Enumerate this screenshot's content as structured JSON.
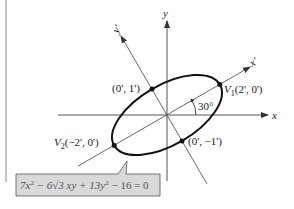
{
  "diagram": {
    "type": "rotated-ellipse",
    "axes": {
      "x_label": "x",
      "y_label": "y",
      "x_prime_label": "x'",
      "y_prime_label": "y'",
      "rotation_angle_label": "30°"
    },
    "points": {
      "v1": {
        "name": "V",
        "sub": "1",
        "coords": "(2', 0')"
      },
      "v2": {
        "name": "V",
        "sub": "2",
        "coords": "(−2', 0')"
      },
      "co_vertex_top": "(0', 1')",
      "co_vertex_bottom": "(0', −1')"
    },
    "equation": {
      "part1": "7x",
      "sup1": "2",
      "part2": " − 6√3 xy + 13y",
      "sup2": "2",
      "part3": " − 16 = 0"
    },
    "colors": {
      "line": "#555555",
      "ellipse": "#111111",
      "callout_fill": "#d9d9d9",
      "callout_border": "#666666"
    }
  }
}
